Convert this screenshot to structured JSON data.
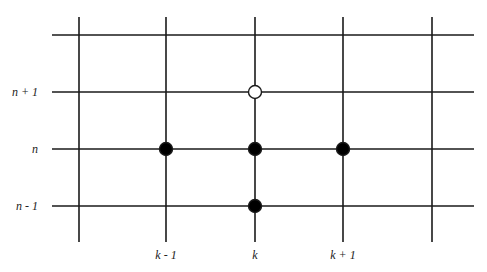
{
  "diagram": {
    "type": "finite-difference-stencil-grid",
    "line_color": "#1a1a1a",
    "node_fill_color": "#000000",
    "open_node_fill_color": "#ffffff",
    "columns": [
      {
        "x": 79,
        "label": ""
      },
      {
        "x": 166,
        "label": "k - 1"
      },
      {
        "x": 255,
        "label": "k"
      },
      {
        "x": 343,
        "label": "k + 1"
      },
      {
        "x": 432,
        "label": ""
      }
    ],
    "rows": [
      {
        "y": 35,
        "label": ""
      },
      {
        "y": 92,
        "label": "n + 1"
      },
      {
        "y": 149,
        "label": "n"
      },
      {
        "y": 206,
        "label": "n - 1"
      }
    ],
    "vertical_extent": {
      "y1": 17,
      "y2": 242
    },
    "horizontal_extent": {
      "x1": 52,
      "x2": 474
    },
    "nodes": [
      {
        "col": "k - 1",
        "row": "n",
        "x": 166,
        "y": 149,
        "filled": true
      },
      {
        "col": "k",
        "row": "n",
        "x": 255,
        "y": 149,
        "filled": true
      },
      {
        "col": "k + 1",
        "row": "n",
        "x": 343,
        "y": 149,
        "filled": true
      },
      {
        "col": "k",
        "row": "n - 1",
        "x": 255,
        "y": 206,
        "filled": true
      },
      {
        "col": "k",
        "row": "n + 1",
        "x": 255,
        "y": 92,
        "filled": false
      }
    ]
  }
}
